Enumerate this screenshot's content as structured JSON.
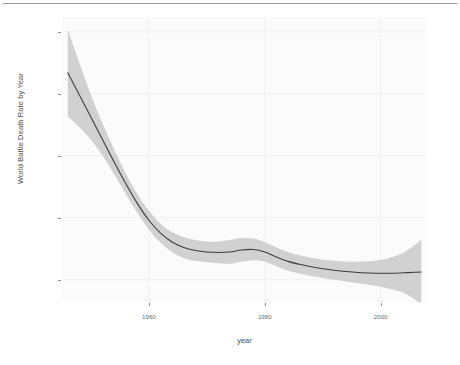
{
  "figure": {
    "background_color": "#ffffff",
    "panel_background_color": "#fbfbfb",
    "gridline_color": "#f2f2f2"
  },
  "axes": {
    "y_title": "World Battle Death Rate by Year",
    "x_title": "year",
    "y_tick_labels": [
      "1.0e-05",
      "7.5e-06",
      "5.0e-06",
      "2.5e-06",
      "0.0e+00"
    ],
    "x_tick_labels": [
      "1960",
      "1980",
      "2000"
    ]
  },
  "chart_data": {
    "type": "line",
    "title": "",
    "subtitle": "",
    "xlabel": "year",
    "ylabel": "World Battle Death Rate by Year",
    "xlim": [
      1945,
      2008
    ],
    "ylim": [
      -9e-07,
      1.06e-05
    ],
    "xticks": [
      1960,
      1980,
      2000
    ],
    "yticks": [
      0.0,
      2.5e-06,
      5e-06,
      7.5e-06,
      1e-05
    ],
    "ytick_labels": [
      "0.0e+00",
      "2.5e-06",
      "5.0e-06",
      "7.5e-06",
      "1.0e-05"
    ],
    "xtick_labels": [
      "1960",
      "1980",
      "2000"
    ],
    "grid": true,
    "legend": false,
    "legend_position": "none",
    "line_color": "#3d3d3d",
    "ribbon_color": "#cfcfcf",
    "series": [
      {
        "name": "LOESS fit",
        "type": "line",
        "x": [
          1946,
          1948,
          1950,
          1952,
          1954,
          1956,
          1958,
          1960,
          1962,
          1964,
          1966,
          1968,
          1970,
          1972,
          1974,
          1976,
          1978,
          1980,
          1982,
          1984,
          1986,
          1988,
          1990,
          1992,
          1994,
          1996,
          1998,
          2000,
          2002,
          2004,
          2006,
          2007
        ],
        "values": [
          8.35e-06,
          7.45e-06,
          6.55e-06,
          5.65e-06,
          4.75e-06,
          3.88e-06,
          3.08e-06,
          2.4e-06,
          1.88e-06,
          1.52e-06,
          1.3e-06,
          1.18e-06,
          1.12e-06,
          1.1e-06,
          1.12e-06,
          1.2e-06,
          1.22e-06,
          1.12e-06,
          9.2e-07,
          7.4e-07,
          6.2e-07,
          5.2e-07,
          4.4e-07,
          3.8e-07,
          3.3e-07,
          2.9e-07,
          2.7e-07,
          2.6e-07,
          2.6e-07,
          2.8e-07,
          3e-07,
          3.1e-07
        ]
      },
      {
        "name": "confidence ribbon upper",
        "type": "ribbon-upper",
        "x": [
          1946,
          1948,
          1950,
          1952,
          1954,
          1956,
          1958,
          1960,
          1962,
          1964,
          1966,
          1968,
          1970,
          1972,
          1974,
          1976,
          1978,
          1980,
          1982,
          1984,
          1986,
          1988,
          1990,
          1992,
          1994,
          1996,
          1998,
          2000,
          2002,
          2004,
          2006,
          2007
        ],
        "values": [
          1.01e-05,
          8.75e-06,
          7.45e-06,
          6.3e-06,
          5.25e-06,
          4.3e-06,
          3.46e-06,
          2.78e-06,
          2.26e-06,
          1.92e-06,
          1.72e-06,
          1.6e-06,
          1.54e-06,
          1.54e-06,
          1.6e-06,
          1.68e-06,
          1.66e-06,
          1.52e-06,
          1.3e-06,
          1.12e-06,
          9.9e-07,
          8.9e-07,
          8.1e-07,
          7.6e-07,
          7.3e-07,
          7.2e-07,
          7.4e-07,
          8e-07,
          9.2e-07,
          1.1e-06,
          1.42e-06,
          1.62e-06
        ]
      },
      {
        "name": "confidence ribbon lower",
        "type": "ribbon-lower",
        "x": [
          1946,
          1948,
          1950,
          1952,
          1954,
          1956,
          1958,
          1960,
          1962,
          1964,
          1966,
          1968,
          1970,
          1972,
          1974,
          1976,
          1978,
          1980,
          1982,
          1984,
          1986,
          1988,
          1990,
          1992,
          1994,
          1996,
          1998,
          2000,
          2002,
          2004,
          2006,
          2007
        ],
        "values": [
          6.6e-06,
          6.15e-06,
          5.65e-06,
          5e-06,
          4.25e-06,
          3.46e-06,
          2.7e-06,
          2.02e-06,
          1.5e-06,
          1.12e-06,
          8.8e-07,
          7.6e-07,
          7e-07,
          6.6e-07,
          6.4e-07,
          7.2e-07,
          7.8e-07,
          7.2e-07,
          5.4e-07,
          3.6e-07,
          2.5e-07,
          1.5e-07,
          7e-08,
          0.0,
          -7e-08,
          -1.4e-07,
          -2e-07,
          -2.8e-07,
          -4e-07,
          -5.4e-07,
          -8.2e-07,
          -1e-06
        ]
      }
    ]
  }
}
